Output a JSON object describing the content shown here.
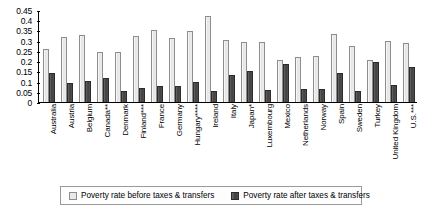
{
  "chart_data": {
    "type": "bar",
    "title": "",
    "xlabel": "",
    "ylabel": "",
    "ylim": [
      0,
      0.45
    ],
    "grid": false,
    "legend_position": "bottom",
    "yticks": [
      "0",
      "0.05",
      "0.1",
      "0.15",
      "0.2",
      "0.25",
      "0.3",
      "0.35",
      "0.4",
      "0.45"
    ],
    "ytick_values": [
      0,
      0.05,
      0.1,
      0.15,
      0.2,
      0.25,
      0.3,
      0.35,
      0.4,
      0.45
    ],
    "categories": [
      "Australia",
      "Austria",
      "Belgium",
      "Canada**",
      "Denmark",
      "Finland***",
      "France",
      "Germany",
      "Hungary****",
      "Ireland",
      "Italy",
      "Japan*",
      "Luxembourg",
      "Mexico",
      "Netherlands",
      "Norway",
      "Spain",
      "Sweden",
      "Turkey",
      "United Kingdom",
      "U.S.***"
    ],
    "series": [
      {
        "name": "Poverty rate before taxes & transfers",
        "color": "#e9e9e9",
        "values": [
          0.26,
          0.32,
          0.33,
          0.245,
          0.245,
          0.325,
          0.352,
          0.315,
          0.345,
          0.42,
          0.305,
          0.295,
          0.295,
          0.205,
          0.22,
          0.225,
          0.335,
          0.275,
          0.205,
          0.3,
          0.29
        ]
      },
      {
        "name": "Poverty rate after taxes & transfers",
        "color": "#474747",
        "values": [
          0.14,
          0.095,
          0.105,
          0.118,
          0.055,
          0.068,
          0.078,
          0.08,
          0.1,
          0.053,
          0.13,
          0.152,
          0.057,
          0.185,
          0.062,
          0.065,
          0.14,
          0.053,
          0.195,
          0.083,
          0.17
        ]
      }
    ]
  },
  "legend": {
    "entries": [
      "Poverty rate before taxes & transfers",
      "Poverty rate after taxes & transfers"
    ]
  }
}
